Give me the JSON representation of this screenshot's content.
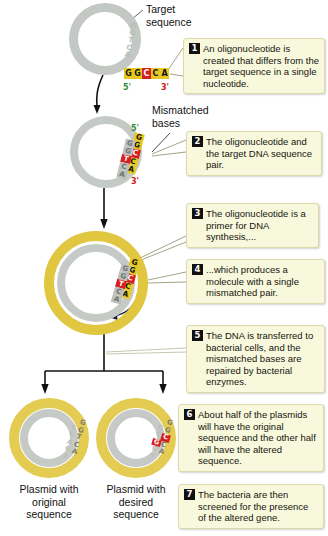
{
  "figure": {
    "labels": {
      "target_sequence": "Target\nsequence",
      "mismatched_bases": "Mismatched\nbases",
      "plasmid_original": "Plasmid with\noriginal\nsequence",
      "plasmid_desired": "Plasmid with\ndesired\nsequence"
    }
  },
  "colors": {
    "ring_gray": "#c4c8c4",
    "ring_yellow": "#e1c63f",
    "base_yellow": "#e8c820",
    "base_red": "#d81f1f",
    "callout_bg": "#f8f8dc",
    "callout_border": "#ded9a8",
    "badge_bg": "#111111",
    "label_5prime": "#2f8f35",
    "label_3prime": "#cc2222"
  },
  "steps": [
    {
      "number": "1",
      "text": "An oligonucleotide is created that differs from the target sequence in a single nucleotide."
    },
    {
      "number": "2",
      "text": "The oligonucleotide and the target DNA sequence pair."
    },
    {
      "number": "3",
      "text": "The oligonucleotide is a primer for DNA synthesis,..."
    },
    {
      "number": "4",
      "text": "...which produces a molecule with a single mismatched pair."
    },
    {
      "number": "5",
      "text": "The DNA is transferred to bacterial cells, and the mismatched bases are repaired by bacterial enzymes."
    },
    {
      "number": "6",
      "text": "About half of the plasmids will have the original sequence and the other half will have the altered sequence."
    },
    {
      "number": "7",
      "text": "The bacteria are then screened for the presence of the altered gene."
    }
  ],
  "sequences": {
    "oligo": {
      "bases": [
        "G",
        "G",
        "C",
        "C",
        "A"
      ],
      "mutant_index": 2,
      "five_prime": "5'",
      "three_prime": "3'"
    },
    "target_strand": {
      "bases": [
        "G",
        "G",
        "T",
        "C",
        "A"
      ]
    },
    "plasmid_top_faint": {
      "bases": [
        "G",
        "G",
        "T",
        "C",
        "A"
      ]
    },
    "plasmid_original": {
      "top_bases": [
        "G",
        "G",
        "T",
        "C",
        "A"
      ],
      "bottom_bases": [
        "C",
        "C",
        "A",
        "G",
        "T"
      ]
    },
    "plasmid_desired": {
      "top_bases": [
        "G",
        "G",
        "C",
        "C",
        "A"
      ],
      "bottom_bases": [
        "C",
        "C",
        "G",
        "G",
        "T"
      ],
      "mutant_index": 2
    }
  }
}
